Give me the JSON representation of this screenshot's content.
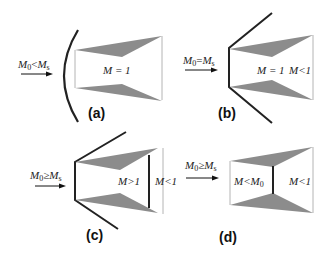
{
  "figure": {
    "colors": {
      "shock": "#222222",
      "wedge": "#8c8c8c",
      "wall": "#b4b4b4",
      "arrow": "#111111"
    },
    "panels": [
      {
        "id": "a",
        "caption": "(a)",
        "inflow": "M0<Ms",
        "inflow_parts": {
          "lhs": "M",
          "lhs_sub": "0",
          "op": "<",
          "rhs": "M",
          "rhs_sub": "s"
        },
        "region_labels": [
          "M = 1"
        ]
      },
      {
        "id": "b",
        "caption": "(b)",
        "inflow": "M0=Ms",
        "inflow_parts": {
          "lhs": "M",
          "lhs_sub": "0",
          "op": "=",
          "rhs": "M",
          "rhs_sub": "s"
        },
        "region_labels": [
          "M = 1",
          "M<1"
        ]
      },
      {
        "id": "c",
        "caption": "(c)",
        "inflow": "M0≥Ms",
        "inflow_parts": {
          "lhs": "M",
          "lhs_sub": "0",
          "op": "≥",
          "rhs": "M",
          "rhs_sub": "s"
        },
        "region_labels": [
          "M>1",
          "M<1"
        ]
      },
      {
        "id": "d",
        "caption": "(d)",
        "inflow": "M0≥Ms",
        "inflow_parts": {
          "lhs": "M",
          "lhs_sub": "0",
          "op": "≥",
          "rhs": "M",
          "rhs_sub": "s"
        },
        "region_labels": [
          "M<M0",
          "M<1"
        ],
        "region_label_parts": {
          "first": {
            "a": "M<M",
            "sub": "0"
          }
        }
      }
    ]
  }
}
